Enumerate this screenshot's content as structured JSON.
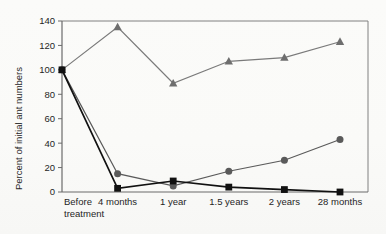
{
  "chart_data": {
    "type": "line",
    "title": "",
    "xlabel": "",
    "ylabel": "Percent of initial ant numbers",
    "categories": [
      "Before treatment",
      "4 months",
      "1 year",
      "1.5 years",
      "2 years",
      "28 months"
    ],
    "category_lines": [
      [
        "Before",
        "treatment"
      ],
      [
        "4 months"
      ],
      [
        "1 year"
      ],
      [
        "1.5 years"
      ],
      [
        "2 years"
      ],
      [
        "28 months"
      ]
    ],
    "ylim": [
      0,
      140
    ],
    "yticks": [
      0,
      20,
      40,
      60,
      80,
      100,
      120,
      140
    ],
    "ytick_labels": [
      "0",
      "20",
      "40",
      "60",
      "80",
      "100",
      "120",
      "140"
    ],
    "grid": false,
    "legend": "none",
    "series": [
      {
        "name": "triangle-series",
        "marker": "triangle",
        "color": "#6e6e6e",
        "line_color": "#7a7a7a",
        "values": [
          100,
          135,
          89,
          107,
          110,
          123
        ]
      },
      {
        "name": "circle-series",
        "marker": "circle",
        "color": "#5a5a5a",
        "line_color": "#5a5a5a",
        "values": [
          100,
          15,
          5,
          17,
          26,
          43
        ]
      },
      {
        "name": "square-series",
        "marker": "square",
        "color": "#111111",
        "line_color": "#111111",
        "values": [
          100,
          3,
          9,
          4,
          2,
          0
        ]
      }
    ]
  }
}
